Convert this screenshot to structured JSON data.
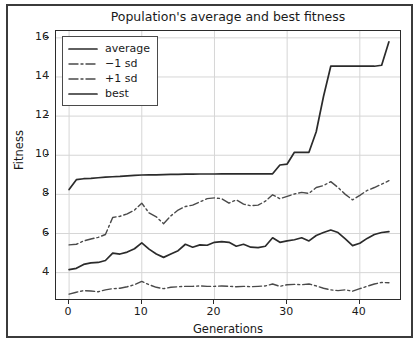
{
  "chart_data": {
    "type": "line",
    "title": "Population's average and best fitness",
    "xlabel": "Generations",
    "ylabel": "Fitness",
    "xlim": [
      -1.8,
      45.8
    ],
    "ylim": [
      2.55,
      16.35
    ],
    "xticks": [
      0,
      10,
      20,
      30,
      40
    ],
    "yticks": [
      4,
      6,
      8,
      10,
      12,
      14,
      16
    ],
    "grid": true,
    "legend_position": "upper left",
    "x": [
      0,
      1,
      2,
      3,
      4,
      5,
      6,
      7,
      8,
      9,
      10,
      11,
      12,
      13,
      14,
      15,
      16,
      17,
      18,
      19,
      20,
      21,
      22,
      23,
      24,
      25,
      26,
      27,
      28,
      29,
      30,
      31,
      32,
      33,
      34,
      35,
      36,
      37,
      38,
      39,
      40,
      41,
      42,
      43,
      44
    ],
    "series": [
      {
        "name": "average",
        "style": "solid",
        "color": "#2b2b2b",
        "values": [
          4.15,
          4.22,
          4.42,
          4.5,
          4.52,
          4.62,
          5.0,
          4.95,
          5.05,
          5.22,
          5.52,
          5.2,
          4.95,
          4.78,
          4.95,
          5.12,
          5.45,
          5.3,
          5.42,
          5.4,
          5.55,
          5.58,
          5.55,
          5.35,
          5.45,
          5.3,
          5.28,
          5.35,
          5.78,
          5.55,
          5.62,
          5.68,
          5.78,
          5.62,
          5.9,
          6.05,
          6.18,
          6.05,
          5.72,
          5.38,
          5.5,
          5.75,
          5.95,
          6.05,
          6.1
        ]
      },
      {
        "name": "−1 sd",
        "style": "dashdot",
        "color": "#4a4a4a",
        "values": [
          2.9,
          3.0,
          3.08,
          3.06,
          3.02,
          3.12,
          3.18,
          3.2,
          3.28,
          3.38,
          3.55,
          3.38,
          3.25,
          3.18,
          3.25,
          3.28,
          3.3,
          3.3,
          3.32,
          3.3,
          3.3,
          3.32,
          3.3,
          3.28,
          3.3,
          3.28,
          3.3,
          3.32,
          3.42,
          3.3,
          3.38,
          3.4,
          3.38,
          3.42,
          3.32,
          3.2,
          3.12,
          3.08,
          3.12,
          3.05,
          3.18,
          3.3,
          3.42,
          3.5,
          3.48
        ]
      },
      {
        "name": "+1 sd",
        "style": "dashdot",
        "color": "#4a4a4a",
        "values": [
          5.42,
          5.45,
          5.62,
          5.72,
          5.8,
          5.95,
          6.82,
          6.88,
          7.0,
          7.2,
          7.55,
          7.05,
          6.85,
          6.5,
          6.9,
          7.2,
          7.38,
          7.45,
          7.62,
          7.78,
          7.82,
          7.78,
          7.55,
          7.72,
          7.5,
          7.42,
          7.45,
          7.65,
          7.98,
          7.78,
          7.9,
          8.02,
          8.1,
          8.05,
          8.35,
          8.45,
          8.65,
          8.35,
          8.0,
          7.72,
          7.95,
          8.2,
          8.35,
          8.52,
          8.7
        ]
      },
      {
        "name": "best",
        "style": "solid",
        "color": "#2b2b2b",
        "values": [
          8.25,
          8.75,
          8.8,
          8.82,
          8.85,
          8.88,
          8.9,
          8.92,
          8.95,
          8.97,
          8.99,
          9.0,
          9.0,
          9.01,
          9.02,
          9.02,
          9.03,
          9.03,
          9.04,
          9.04,
          9.04,
          9.05,
          9.05,
          9.05,
          9.05,
          9.05,
          9.05,
          9.05,
          9.05,
          9.5,
          9.55,
          10.15,
          10.15,
          10.15,
          11.2,
          13.0,
          14.55,
          14.55,
          14.55,
          14.55,
          14.55,
          14.55,
          14.55,
          14.6,
          15.8
        ]
      }
    ]
  },
  "legend": {
    "items": [
      {
        "label": "average",
        "style": "solid"
      },
      {
        "label": "−1 sd",
        "style": "dashdot"
      },
      {
        "label": "+1 sd",
        "style": "dashdot"
      },
      {
        "label": "best",
        "style": "solid"
      }
    ]
  },
  "colors": {
    "line_dark": "#2b2b2b",
    "line_mid": "#4a4a4a",
    "grid": "#d6d6d6",
    "axis": "#2b2b2b",
    "frame": "#3b3b3b",
    "background": "#ffffff"
  }
}
